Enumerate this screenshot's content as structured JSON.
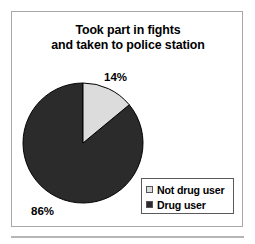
{
  "figure": {
    "title_line1": "Took part in fights",
    "title_line2": "and taken to police station",
    "frame_border_color": "#a8a8a8",
    "background_color": "#ffffff"
  },
  "legend": {
    "border_color": "#5a5a5a",
    "items": [
      {
        "label": "Not drug user",
        "swatch_color": "#dcdcdc"
      },
      {
        "label": "Drug user",
        "swatch_color": "#2b2b2b"
      }
    ]
  },
  "labels": {
    "top": "14%",
    "bottom": "86%"
  },
  "chart_data": {
    "type": "pie",
    "title": "Took part in fights and taken to police station",
    "categories": [
      "Not drug user",
      "Drug user"
    ],
    "values": [
      14,
      86
    ],
    "value_unit": "%",
    "data_labels": [
      "14%",
      "86%"
    ],
    "colors": [
      "#dcdcdc",
      "#2b2b2b"
    ],
    "slice_border_color": "#000000",
    "start_angle_deg": 0,
    "direction": "clockwise",
    "legend": true,
    "legend_position": "bottom-right",
    "xlabel": "",
    "ylabel": ""
  }
}
